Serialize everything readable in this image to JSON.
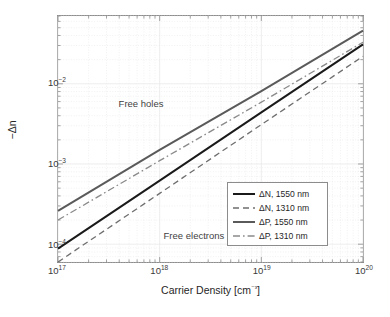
{
  "chart_data": {
    "type": "line",
    "title": "",
    "xlabel": "Carrier Density [cm⁻³]",
    "ylabel": "−Δn",
    "xscale": "log",
    "yscale": "log",
    "xlim": [
      1e+17,
      1e+20
    ],
    "ylim": [
      6e-05,
      0.07
    ],
    "grid": true,
    "minor_grid": true,
    "legend_position": "lower right",
    "xticks": [
      {
        "value": 1e+17,
        "label": "10",
        "exp": "17"
      },
      {
        "value": 1e+18,
        "label": "10",
        "exp": "18"
      },
      {
        "value": 1e+19,
        "label": "10",
        "exp": "19"
      },
      {
        "value": 1e+20,
        "label": "10",
        "exp": "20"
      }
    ],
    "yticks": [
      {
        "value": 0.01,
        "label": "10",
        "exp": "-2"
      },
      {
        "value": 0.001,
        "label": "10",
        "exp": "-3"
      },
      {
        "value": 0.0001,
        "label": "10",
        "exp": "-4"
      }
    ],
    "series": [
      {
        "name": "ΔN, 1550 nm",
        "style": "solid",
        "color": "#1a1a1a",
        "width": 2.0,
        "x": [
          1e+17,
          1e+18,
          1e+19,
          1e+20
        ],
        "y": [
          8.8e-05,
          0.00062,
          0.0044,
          0.031
        ]
      },
      {
        "name": "ΔN, 1310 nm",
        "style": "dashed",
        "color": "#6e6e6e",
        "width": 1.3,
        "x": [
          1e+17,
          1e+18,
          1e+19,
          1e+20
        ],
        "y": [
          6e-05,
          0.00043,
          0.0031,
          0.022
        ]
      },
      {
        "name": "ΔP, 1550 nm",
        "style": "solid",
        "color": "#5a5a5a",
        "width": 2.0,
        "x": [
          1e+17,
          1e+18,
          1e+19,
          1e+20
        ],
        "y": [
          0.00026,
          0.0015,
          0.0081,
          0.046
        ]
      },
      {
        "name": "ΔP, 1310 nm",
        "style": "dashdot",
        "color": "#8a8a8a",
        "width": 1.3,
        "x": [
          1e+17,
          1e+18,
          1e+19,
          1e+20
        ],
        "y": [
          0.0002,
          0.0011,
          0.0059,
          0.033
        ]
      }
    ],
    "annotations": [
      {
        "text": "Free holes",
        "x": 4e+17,
        "y": 0.0055
      },
      {
        "text": "Free electrons",
        "x": 1.1e+18,
        "y": 0.00013
      }
    ]
  }
}
